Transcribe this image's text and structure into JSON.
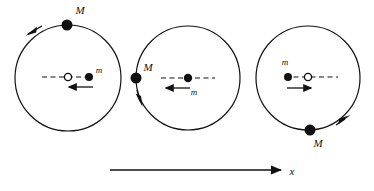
{
  "figure": {
    "title": "",
    "background_color": "#ffffff",
    "stroke_color": "#111111",
    "fill_color": "#111111",
    "open_marker_fill": "#ffffff",
    "width": 374,
    "height": 191
  },
  "axis": {
    "label": "x",
    "label_x": 292,
    "label_y": 176,
    "arrow_start_x": 110,
    "arrow_end_x": 283,
    "arrow_y": 170,
    "direction": "right"
  },
  "panels": [
    {
      "id": "panel-left",
      "circle": {
        "cx": 68,
        "cy": 78,
        "r": 53
      },
      "big_mass": {
        "label": "M",
        "x": 67,
        "y": 25,
        "r": 5.5,
        "label_x": 80,
        "label_y": 14,
        "position_on_orbit": "top"
      },
      "orbit_arrow": {
        "direction": "counterclockwise",
        "arrow_angle_deg": 212,
        "tip_x": 27,
        "tip_y": 34
      },
      "center_of_mass": {
        "x": 68,
        "y": 77,
        "r": 3.6,
        "style": "open"
      },
      "small_mass": {
        "label": "m",
        "x": 89,
        "y": 77,
        "r": 4,
        "label_x": 99,
        "label_y": 72
      },
      "dashed_line": {
        "x1": 42,
        "x2": 92,
        "y": 77
      },
      "velocity_arrow": {
        "direction": "left",
        "x_start": 93,
        "x_end": 68,
        "y": 87
      }
    },
    {
      "id": "panel-middle",
      "circle": {
        "cx": 188,
        "cy": 78,
        "r": 52
      },
      "big_mass": {
        "label": "M",
        "x": 136,
        "y": 78,
        "r": 5.5,
        "label_x": 146,
        "label_y": 70,
        "position_on_orbit": "left"
      },
      "orbit_arrow": {
        "direction": "counterclockwise",
        "arrow_angle_deg": 157,
        "tip_x": 141,
        "tip_y": 104
      },
      "center_of_mass": {
        "x": 188,
        "y": 78,
        "r": 3.6,
        "style": "hidden"
      },
      "small_mass": {
        "label": "m",
        "x": 188,
        "y": 78,
        "r": 4,
        "label_x": 192,
        "label_y": 93
      },
      "dashed_line": {
        "x1": 161,
        "x2": 215,
        "y": 78
      },
      "velocity_arrow": {
        "direction": "left",
        "x_start": 190,
        "x_end": 165,
        "y": 88
      }
    },
    {
      "id": "panel-right",
      "circle": {
        "cx": 308,
        "cy": 78,
        "r": 52
      },
      "big_mass": {
        "label": "M",
        "x": 310,
        "y": 130,
        "r": 5.5,
        "label_x": 316,
        "label_y": 146,
        "position_on_orbit": "bottom"
      },
      "orbit_arrow": {
        "direction": "counterclockwise",
        "arrow_angle_deg": 30,
        "tip_x": 348,
        "tip_y": 119
      },
      "center_of_mass": {
        "x": 308,
        "y": 77,
        "r": 3.6,
        "style": "open"
      },
      "small_mass": {
        "label": "m",
        "x": 288,
        "y": 77,
        "r": 4,
        "label_x": 284,
        "label_y": 64
      },
      "dashed_line": {
        "x1": 285,
        "x2": 338,
        "y": 77
      },
      "velocity_arrow": {
        "direction": "right",
        "x_start": 287,
        "x_end": 312,
        "y": 88
      }
    }
  ]
}
